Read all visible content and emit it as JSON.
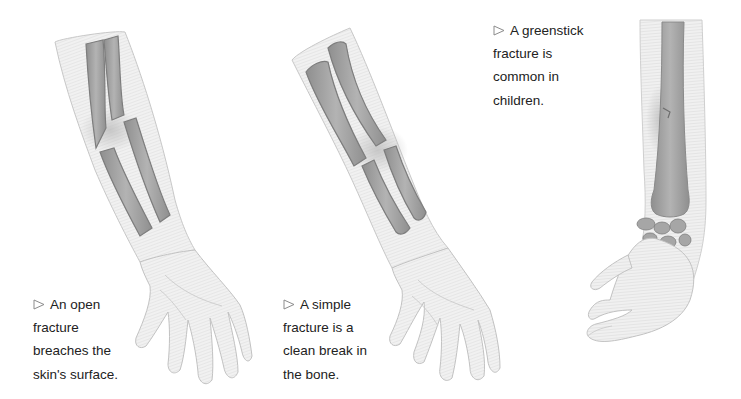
{
  "page": {
    "background": "#ffffff",
    "text_color": "#222222",
    "illustration_color": "#8a8a8a"
  },
  "figures": [
    {
      "id": "open-fracture",
      "icon": "triangle-bullet-icon",
      "caption_lines": [
        "An open",
        "fracture",
        "breaches the",
        "skin's surface."
      ]
    },
    {
      "id": "simple-fracture",
      "icon": "triangle-bullet-icon",
      "caption_lines": [
        "A simple",
        "fracture is a",
        "clean break in",
        "the bone."
      ]
    },
    {
      "id": "greenstick-fracture",
      "icon": "triangle-bullet-icon",
      "caption_lines": [
        "A greenstick",
        "fracture is",
        "common in",
        "children."
      ]
    }
  ]
}
